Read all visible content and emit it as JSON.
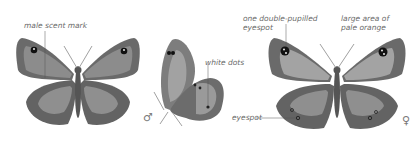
{
  "figure": {
    "panels": [
      {
        "id": "male-upperside",
        "labels": [
          "male scent mark"
        ]
      },
      {
        "id": "male-underside",
        "labels": [
          "white dots"
        ],
        "symbol": "♂"
      },
      {
        "id": "female-upperside",
        "labels": [
          "one double-pupilled",
          "eyespot",
          "large area of",
          "pale orange",
          "eyespot"
        ],
        "symbol": "♀"
      }
    ]
  },
  "labels": {
    "male_scent_mark": "male scent mark",
    "white_dots": "white dots",
    "double_pupilled_1": "one double-pupilled",
    "double_pupilled_2": "eyespot",
    "pale_orange_1": "large area of",
    "pale_orange_2": "pale orange",
    "eyespot": "eyespot",
    "male_symbol": "♂",
    "female_symbol": "♀"
  },
  "colors": {
    "wing_dark": "#5e5e5e",
    "wing_mid": "#8a8a8a",
    "wing_light": "#a8a8a8",
    "text": "#6a6a6a"
  }
}
